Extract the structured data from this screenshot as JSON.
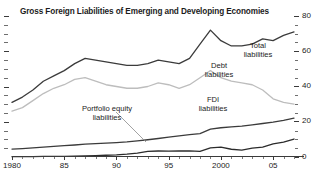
{
  "chart_data": {
    "type": "line",
    "title": "Gross Foreign Liabilities of Emerging and Developing Economies",
    "xlabel": "",
    "ylabel": "",
    "xlim": [
      1980,
      2007
    ],
    "ylim": [
      0,
      80
    ],
    "y_axis_position": "right",
    "grid": false,
    "legend": "in-plot annotations",
    "y_ticks": [
      0,
      20,
      40,
      60,
      80
    ],
    "y_tick_labels": [
      "0",
      "20",
      "40",
      "60",
      "80"
    ],
    "y_minor_ticks": [
      5,
      10,
      15,
      25,
      30,
      35,
      45,
      50,
      55,
      65,
      70,
      75
    ],
    "x_ticks": [
      1980,
      1985,
      1990,
      1995,
      2000,
      2005
    ],
    "x_tick_labels": [
      "1980",
      "85",
      "90",
      "95",
      "2000",
      "05"
    ],
    "x_minor_ticks": [
      1981,
      1982,
      1983,
      1984,
      1986,
      1987,
      1988,
      1989,
      1991,
      1992,
      1993,
      1994,
      1996,
      1997,
      1998,
      1999,
      2001,
      2002,
      2003,
      2004,
      2006,
      2007
    ],
    "x": [
      1980,
      1981,
      1982,
      1983,
      1984,
      1985,
      1986,
      1987,
      1988,
      1989,
      1990,
      1991,
      1992,
      1993,
      1994,
      1995,
      1996,
      1997,
      1998,
      1999,
      2000,
      2001,
      2002,
      2003,
      2004,
      2005,
      2006,
      2007
    ],
    "series": [
      {
        "name": "Total liabilities",
        "color": "#3b3b3b",
        "values": [
          31,
          34,
          38,
          43,
          46,
          49,
          53,
          56,
          55,
          54,
          53,
          52,
          52,
          53,
          55,
          54,
          53,
          56,
          64,
          72,
          66,
          63,
          63,
          64,
          67,
          66,
          69,
          71
        ]
      },
      {
        "name": "Debt liabilities",
        "color": "#bdbdbd",
        "values": [
          26,
          28,
          32,
          36,
          39,
          41,
          44,
          45,
          43,
          41,
          40,
          39,
          39,
          40,
          42,
          41,
          39,
          41,
          45,
          49,
          45,
          43,
          42,
          41,
          38,
          33,
          31,
          30
        ]
      },
      {
        "name": "FDI liabilities",
        "color": "#3b3b3b",
        "values": [
          4.5,
          4.8,
          5.2,
          5.6,
          6.0,
          6.4,
          6.8,
          7.3,
          7.6,
          7.9,
          8.2,
          8.6,
          9.2,
          9.8,
          10.5,
          11.3,
          12.0,
          12.7,
          13.3,
          15.8,
          16.6,
          17.1,
          17.5,
          18.2,
          19.0,
          19.8,
          20.8,
          22.0
        ]
      },
      {
        "name": "Portfolio equity liabilities",
        "color": "#2b2b2b",
        "values": [
          0.2,
          0.2,
          0.2,
          0.3,
          0.3,
          0.4,
          0.5,
          0.6,
          0.8,
          1.0,
          1.2,
          1.6,
          2.2,
          3.2,
          3.4,
          3.3,
          3.4,
          3.5,
          3.2,
          5.2,
          5.6,
          4.4,
          3.9,
          5.0,
          5.6,
          7.4,
          8.4,
          10.2
        ]
      }
    ],
    "annotations": [
      {
        "name": "total-liabilities",
        "text_line1": "Total",
        "text_line2": "liabilities"
      },
      {
        "name": "debt-liabilities",
        "text_line1": "Debt",
        "text_line2": "liabilities"
      },
      {
        "name": "fdi-liabilities",
        "text_line1": "FDI",
        "text_line2": "liabilities"
      },
      {
        "name": "portfolio-equity-liabilities",
        "text_line1": "Portfolio equity",
        "text_line2": "liabilities",
        "has_leader_line": true
      }
    ]
  },
  "title": "Gross Foreign Liabilities of Emerging and Developing Economies",
  "annotations": {
    "total": {
      "l1": "Total",
      "l2": "liabilities"
    },
    "debt": {
      "l1": "Debt",
      "l2": "liabilities"
    },
    "fdi": {
      "l1": "FDI",
      "l2": "liabilities"
    },
    "portfolio_equity": {
      "l1": "Portfolio equity",
      "l2": "liabilities"
    }
  }
}
